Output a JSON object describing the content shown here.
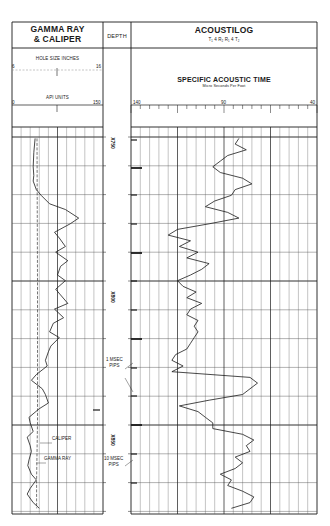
{
  "chart_data": {
    "type": "line",
    "tracks": [
      {
        "name": "GAMMA RAY & CALIPER",
        "title_lines": [
          "GAMMA RAY",
          "& CALIPER"
        ],
        "scales": [
          {
            "label": "HOLE SIZE INCHES",
            "min": 6,
            "max": 16,
            "min_label": "6",
            "max_label": "16"
          },
          {
            "label": "API UNITS",
            "min": 0,
            "max": 150,
            "min_label": "0",
            "max_label": "150"
          }
        ],
        "series": [
          {
            "name": "GAMMA RAY",
            "unit": "API",
            "depth": [
              750,
              755,
              760,
              763,
              765,
              768,
              770,
              773,
              775,
              778,
              780,
              783,
              785,
              788,
              790,
              793,
              795,
              798,
              800,
              803,
              805,
              808,
              810,
              813,
              815,
              818,
              820,
              823,
              825,
              828,
              830,
              833,
              835,
              838,
              840,
              843,
              845,
              848,
              850,
              853,
              855,
              858,
              860,
              863,
              865,
              868,
              870,
              873,
              875,
              878,
              880
            ],
            "values": [
              38,
              36,
              35,
              36,
              35,
              40,
              48,
              62,
              88,
              110,
              96,
              70,
              78,
              88,
              72,
              92,
              80,
              75,
              88,
              72,
              80,
              92,
              70,
              85,
              68,
              62,
              78,
              64,
              60,
              55,
              58,
              40,
              32,
              50,
              55,
              60,
              45,
              28,
              30,
              35,
              25,
              30,
              32,
              28,
              26,
              32,
              40,
              30,
              25,
              35,
              45
            ]
          },
          {
            "name": "CALIPER",
            "unit": "inches",
            "depth": [
              750,
              800,
              850,
              870,
              880
            ],
            "values": [
              8.75,
              8.8,
              8.8,
              8.7,
              8.7
            ]
          }
        ]
      },
      {
        "name": "DEPTH",
        "depth_labels": [
          "X750",
          "X800",
          "X850"
        ]
      },
      {
        "name": "ACOUSTILOG",
        "subtitle": "T₁ 4 R₂ R₁ 4 T₂",
        "scale_title": "SPECIFIC ACOUSTIC TIME",
        "scale_unit": "Micro Seconds Per Foot",
        "scale": {
          "min": 140,
          "max": 40,
          "ticks": [
            "140",
            "90",
            "40"
          ]
        },
        "series": [
          {
            "name": "Specific Acoustic Time",
            "unit": "µs/ft",
            "depth": [
              750,
              752,
              754,
              756,
              758,
              760,
              762,
              764,
              766,
              768,
              770,
              772,
              774,
              776,
              778,
              780,
              782,
              784,
              786,
              788,
              790,
              792,
              794,
              796,
              798,
              800,
              802,
              804,
              806,
              808,
              810,
              812,
              814,
              816,
              818,
              820,
              822,
              824,
              826,
              828,
              830,
              832,
              834,
              836,
              838,
              840,
              842,
              844,
              846,
              848,
              850,
              852,
              854,
              856,
              858,
              860,
              862,
              864,
              866,
              868,
              870,
              872,
              874,
              876,
              878,
              880
            ],
            "values": [
              82,
              84,
              78,
              88,
              92,
              96,
              92,
              80,
              75,
              84,
              86,
              95,
              100,
              88,
              82,
              98,
              115,
              120,
              108,
              114,
              104,
              110,
              98,
              102,
              108,
              115,
              112,
              105,
              110,
              102,
              108,
              110,
              104,
              106,
              104,
              106,
              108,
              110,
              116,
              118,
              112,
              118,
              76,
              72,
              76,
              80,
              98,
              114,
              104,
              100,
              96,
              96,
              80,
              74,
              78,
              76,
              84,
              80,
              84,
              92,
              86,
              88,
              80,
              74,
              76,
              86
            ]
          }
        ]
      }
    ],
    "annotations": [
      "1 MSEC PIPS",
      "10 MSEC PIPS",
      "CALIPER",
      "GAMMA RAY"
    ],
    "ylim": [
      746,
      882
    ],
    "grid": true
  },
  "header": {
    "left_title_1": "GAMMA RAY",
    "left_title_2": "& CALIPER",
    "depth_title": "DEPTH",
    "right_title": "ACOUSTILOG",
    "right_subtitle": "T₁ 4 R₂ R₁ 4 T₂",
    "hole_size_label": "HOLE SIZE INCHES",
    "hole_min": "6",
    "hole_max": "16",
    "api_label": "API UNITS",
    "api_min": "0",
    "api_max": "150",
    "sat_title": "SPECIFIC ACOUSTIC TIME",
    "sat_unit": "Micro Seconds Per Foot",
    "sat_140": "140",
    "sat_90": "90",
    "sat_40": "40"
  },
  "depth_labels": {
    "d750": "X750",
    "d800": "X800",
    "d850": "X850"
  },
  "annotations": {
    "msec1_line1": "1 MSEC",
    "msec1_line2": "PIPS",
    "msec10_line1": "10 MSEC",
    "msec10_line2": "PIPS",
    "caliper": "CALIPER",
    "gamma": "GAMMA RAY"
  },
  "colors": {
    "ink": "#1a1a1a",
    "grid": "#555555",
    "paper": "#ffffff"
  }
}
